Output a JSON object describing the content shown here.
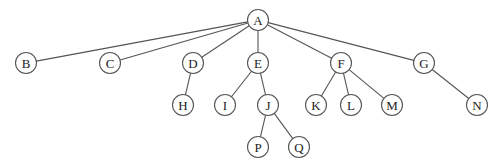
{
  "diagram": {
    "type": "tree",
    "node_radius": 10.5,
    "colors": {
      "stroke": "#555555",
      "fill": "#ffffff",
      "text": "#222222"
    },
    "nodes": [
      {
        "id": "A",
        "label": "A",
        "x": 258,
        "y": 20
      },
      {
        "id": "B",
        "label": "B",
        "x": 26,
        "y": 63
      },
      {
        "id": "C",
        "label": "C",
        "x": 110,
        "y": 63
      },
      {
        "id": "D",
        "label": "D",
        "x": 193,
        "y": 63
      },
      {
        "id": "E",
        "label": "E",
        "x": 258,
        "y": 63
      },
      {
        "id": "F",
        "label": "F",
        "x": 341,
        "y": 63
      },
      {
        "id": "G",
        "label": "G",
        "x": 424,
        "y": 63
      },
      {
        "id": "H",
        "label": "H",
        "x": 183,
        "y": 105
      },
      {
        "id": "I",
        "label": "I",
        "x": 225,
        "y": 105
      },
      {
        "id": "J",
        "label": "J",
        "x": 268,
        "y": 105
      },
      {
        "id": "K",
        "label": "K",
        "x": 316,
        "y": 105
      },
      {
        "id": "L",
        "label": "L",
        "x": 351,
        "y": 105
      },
      {
        "id": "M",
        "label": "M",
        "x": 392,
        "y": 105
      },
      {
        "id": "N",
        "label": "N",
        "x": 477,
        "y": 105
      },
      {
        "id": "P",
        "label": "P",
        "x": 258,
        "y": 147
      },
      {
        "id": "Q",
        "label": "Q",
        "x": 299,
        "y": 147
      }
    ],
    "edges": [
      [
        "A",
        "B"
      ],
      [
        "A",
        "C"
      ],
      [
        "A",
        "D"
      ],
      [
        "A",
        "E"
      ],
      [
        "A",
        "F"
      ],
      [
        "A",
        "G"
      ],
      [
        "D",
        "H"
      ],
      [
        "E",
        "I"
      ],
      [
        "E",
        "J"
      ],
      [
        "F",
        "K"
      ],
      [
        "F",
        "L"
      ],
      [
        "F",
        "M"
      ],
      [
        "G",
        "N"
      ],
      [
        "J",
        "P"
      ],
      [
        "J",
        "Q"
      ]
    ]
  }
}
